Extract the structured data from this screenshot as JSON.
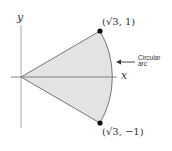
{
  "axes": {
    "x_label": "x",
    "y_label": "y"
  },
  "points": {
    "top": {
      "label": "(√3, 1)"
    },
    "bottom": {
      "label": "(√3, −1)"
    }
  },
  "annotation": {
    "line1": "Circular",
    "line2": "arc"
  },
  "colors": {
    "fill": "#e3e3e3",
    "stroke": "#555555",
    "axis": "#999999",
    "point": "#111111"
  }
}
